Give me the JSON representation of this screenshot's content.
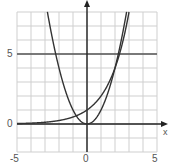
{
  "chart_data": {
    "type": "line",
    "title": "",
    "xlabel": "x",
    "ylabel": "",
    "xlim": [
      -5,
      5
    ],
    "ylim": [
      -2,
      8
    ],
    "grid": true,
    "grid_step": 1,
    "x_ticks": [
      "-5",
      "0",
      "5"
    ],
    "y_ticks": [
      "0",
      "5"
    ],
    "reference_lines": [
      {
        "axis": "y",
        "value": 5
      }
    ],
    "series": [
      {
        "name": "y = x^2",
        "function": "x^2",
        "x": [
          -2.8,
          -2,
          -1,
          0,
          1,
          2,
          2.8
        ],
        "y": [
          7.84,
          4,
          1,
          0,
          1,
          4,
          7.84
        ]
      },
      {
        "name": "y = 2^x",
        "function": "2^x",
        "x": [
          -5,
          -3,
          -1,
          0,
          1,
          2,
          2.95
        ],
        "y": [
          0.03,
          0.125,
          0.5,
          1,
          2,
          4,
          7.73
        ]
      }
    ],
    "intersections": [
      [
        -0.77,
        0.59
      ],
      [
        2,
        4
      ]
    ]
  },
  "labels": {
    "x_axis": "x",
    "x_tick_neg5": "-5",
    "x_tick_0": "0",
    "x_tick_5": "5",
    "y_tick_5": "5",
    "y_tick_0": "0"
  },
  "colors": {
    "grid": "#cfcfcf",
    "axis": "#222222",
    "curve": "#333333",
    "ref_line": "#555555"
  }
}
